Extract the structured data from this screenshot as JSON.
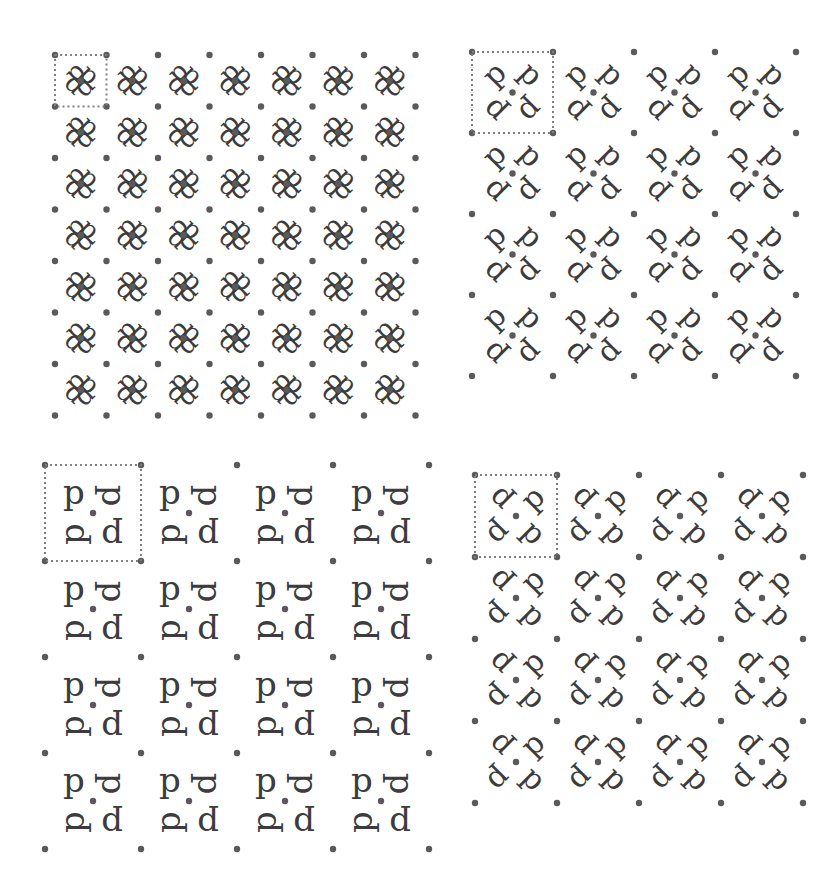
{
  "figure": {
    "glyph": "p",
    "ink_color": "#3c3c3c",
    "dot_color": "#5a5a5a",
    "cell_outline_color": "#808080"
  },
  "panels": [
    {
      "id": "top-left",
      "name": "rosette-pattern",
      "origin": [
        55,
        55
      ],
      "cell_size": 51.5,
      "cols": 7,
      "rows": 7,
      "motif": "rosette",
      "glyphs": [
        {
          "dx": 0.38,
          "dy": 0.33,
          "rot": -45
        },
        {
          "dx": 0.67,
          "dy": 0.38,
          "rot": 45
        },
        {
          "dx": 0.62,
          "dy": 0.67,
          "rot": 135
        },
        {
          "dx": 0.33,
          "dy": 0.62,
          "rot": -135
        }
      ],
      "glyph_size": 26,
      "dots": [
        [
          0,
          0
        ],
        [
          0.5,
          0.5
        ]
      ],
      "unit_cell": {
        "col": 0,
        "row": 0,
        "w": 1,
        "h": 1
      }
    },
    {
      "id": "top-right",
      "name": "diagonal-p-d-pattern",
      "origin": [
        472,
        52
      ],
      "cell_size": 81,
      "cols": 4,
      "rows": 4,
      "motif": "letters",
      "glyphs": [
        {
          "dx": 0.27,
          "dy": 0.27,
          "rot": -45
        },
        {
          "dx": 0.73,
          "dy": 0.27,
          "rot": 45
        },
        {
          "dx": 0.27,
          "dy": 0.73,
          "rot": -135
        },
        {
          "dx": 0.73,
          "dy": 0.73,
          "rot": 135
        }
      ],
      "glyph_size": 30,
      "dots": [
        [
          0,
          0
        ],
        [
          0.5,
          0.5
        ]
      ],
      "unit_cell": {
        "col": 0,
        "row": 0,
        "w": 1,
        "h": 1
      }
    },
    {
      "id": "bottom-left",
      "name": "square-p-d-pattern",
      "origin": [
        45,
        465
      ],
      "cell_size": 96,
      "cols": 4,
      "rows": 4,
      "motif": "letters",
      "glyphs": [
        {
          "dx": 0.3,
          "dy": 0.28,
          "rot": 0
        },
        {
          "dx": 0.72,
          "dy": 0.32,
          "rot": 90
        },
        {
          "dx": 0.28,
          "dy": 0.72,
          "rot": -90
        },
        {
          "dx": 0.7,
          "dy": 0.75,
          "rot": 180
        }
      ],
      "glyph_size": 34,
      "dots": [
        [
          0,
          0
        ],
        [
          0.5,
          0.5
        ]
      ],
      "unit_cell": {
        "col": 0,
        "row": 0,
        "w": 1,
        "h": 1
      }
    },
    {
      "id": "bottom-right",
      "name": "pinwheel-p-d-pattern",
      "origin": [
        475,
        475
      ],
      "cell_size": 82,
      "cols": 4,
      "rows": 4,
      "motif": "letters",
      "glyphs": [
        {
          "dx": 0.3,
          "dy": 0.3,
          "rot": -135
        },
        {
          "dx": 0.7,
          "dy": 0.28,
          "rot": -45
        },
        {
          "dx": 0.3,
          "dy": 0.72,
          "rot": 135
        },
        {
          "dx": 0.72,
          "dy": 0.7,
          "rot": 45
        }
      ],
      "glyph_size": 30,
      "dots": [
        [
          0,
          0
        ],
        [
          0.5,
          0.5
        ]
      ],
      "unit_cell": {
        "col": 0,
        "row": 0,
        "w": 1,
        "h": 1
      }
    }
  ]
}
